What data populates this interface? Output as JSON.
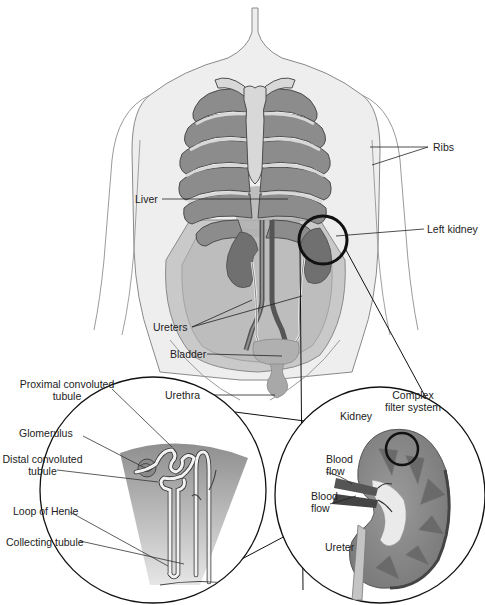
{
  "diagram": {
    "body_labels": {
      "ribs": "Ribs",
      "liver": "Liver",
      "left_kidney": "Left kidney",
      "ureters": "Ureters",
      "bladder": "Bladder",
      "urethra": "Urethra"
    },
    "nephron_labels": {
      "proximal_line1": "Proximal convoluted",
      "proximal_line2": "tubule",
      "glomerulus": "Glomerulus",
      "distal_line1": "Distal convoluted",
      "distal_line2": "tubule",
      "loop_of_henle": "Loop of Henle",
      "collecting_tubule": "Collecting tubule"
    },
    "kidney_labels": {
      "kidney": "Kidney",
      "complex_line1": "Complex",
      "complex_line2": "filter system",
      "blood_flow_1a": "Blood",
      "blood_flow_1b": "flow",
      "blood_flow_2a": "Blood",
      "blood_flow_2b": "flow",
      "ureter": "Ureter"
    },
    "colors": {
      "skin": "#eeeeee",
      "rib": "#8c8c8c",
      "rib_light": "#d8d8d8",
      "organ": "#777777",
      "outline": "#555555",
      "ink": "#111111"
    }
  }
}
